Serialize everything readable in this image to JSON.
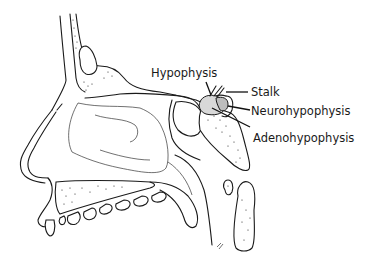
{
  "figure": {
    "labels": [
      {
        "id": "hypophysis",
        "text": "Hypophysis"
      },
      {
        "id": "stalk",
        "text": "Stalk"
      },
      {
        "id": "neurohypophysis",
        "text": "Neurohypophysis"
      },
      {
        "id": "adenohypophysis",
        "text": "Adenohypophysis"
      }
    ],
    "structures": [
      "frontal-bone",
      "frontal-sinus",
      "nasal-bone",
      "nasal-cavity",
      "nasal-conchae",
      "hard-palate",
      "teeth",
      "soft-palate",
      "sphenoid-sinus",
      "sella-turcica",
      "hypophysis",
      "pituitary-stalk",
      "neurohypophysis",
      "adenohypophysis",
      "clivus",
      "cervical-vertebra-atlas",
      "cervical-vertebra-axis",
      "pharynx"
    ]
  }
}
